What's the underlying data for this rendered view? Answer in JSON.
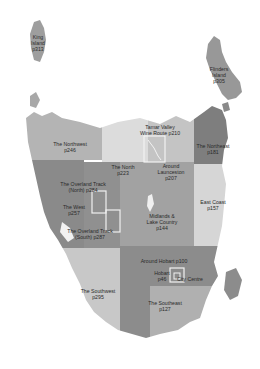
{
  "map": {
    "title": "Tasmania regions",
    "colors": {
      "background": "#ffffff",
      "northwest": "#b4b4b4",
      "north": "#dcdcdc",
      "launceston": "#c2c2c2",
      "northeast": "#7c7c7c",
      "eastcoast": "#d6d6d6",
      "west": "#8a8a8a",
      "midlands": "#a0a0a0",
      "southwest": "#c8c8c8",
      "hobart": "#8c8c8c",
      "southeast": "#b0b0b0",
      "islands": "#9a9a9a",
      "box_outline": "#f2f2f2"
    },
    "regions": [
      {
        "id": "king-island",
        "lines": [
          "King",
          "Island",
          "p313"
        ]
      },
      {
        "id": "flinders-island",
        "lines": [
          "Flinders",
          "Island",
          "p305"
        ]
      },
      {
        "id": "northwest",
        "lines": [
          "The Northwest",
          "p246"
        ]
      },
      {
        "id": "the-north",
        "lines": [
          "The North",
          "p223"
        ]
      },
      {
        "id": "tamar-valley",
        "lines": [
          "Tamar Valley",
          "Wine Route p210"
        ]
      },
      {
        "id": "around-launceston",
        "lines": [
          "Around",
          "Launceston",
          "p207"
        ]
      },
      {
        "id": "northeast",
        "lines": [
          "The Northeast",
          "p181"
        ]
      },
      {
        "id": "overland-north",
        "lines": [
          "The Overland Track",
          "(North) p284"
        ]
      },
      {
        "id": "the-west",
        "lines": [
          "The West",
          "p257"
        ]
      },
      {
        "id": "overland-south",
        "lines": [
          "The Overland Track",
          "(South) p287"
        ]
      },
      {
        "id": "midlands",
        "lines": [
          "Midlands &",
          "Lake Country",
          "p144"
        ]
      },
      {
        "id": "east-coast",
        "lines": [
          "East Coast",
          "p157"
        ]
      },
      {
        "id": "around-hobart",
        "lines": [
          "Around Hobart p100"
        ]
      },
      {
        "id": "hobart",
        "lines": [
          "Hobart",
          "p46"
        ]
      },
      {
        "id": "city-centre",
        "lines": [
          "City Centre"
        ]
      },
      {
        "id": "southwest",
        "lines": [
          "The Southwest",
          "p295"
        ]
      },
      {
        "id": "southeast",
        "lines": [
          "The Southeast",
          "p127"
        ]
      }
    ]
  }
}
